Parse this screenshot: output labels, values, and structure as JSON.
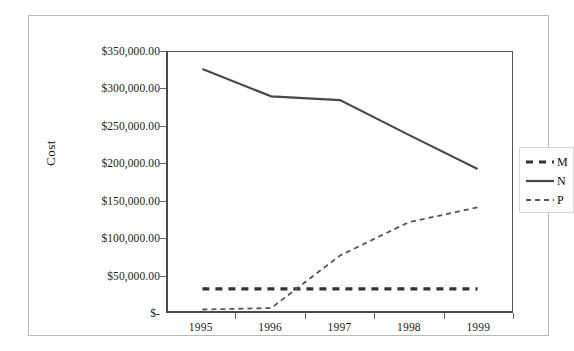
{
  "chart_data": {
    "type": "line",
    "title": "",
    "xlabel": "",
    "ylabel": "Cost",
    "x": [
      1995,
      1996,
      1997,
      1998,
      1999
    ],
    "categories": [
      "1995",
      "1996",
      "1997",
      "1998",
      "1999"
    ],
    "ylim": [
      0,
      350000
    ],
    "ytick_values": [
      0,
      50000,
      100000,
      150000,
      200000,
      250000,
      300000,
      350000
    ],
    "ytick_labels": [
      "$-",
      "$50,000.00",
      "$100,000.00",
      "$150,000.00",
      "$200,000.00",
      "$250,000.00",
      "$300,000.00",
      "$350,000.00"
    ],
    "grid": false,
    "legend_position": "right",
    "series": [
      {
        "name": "M",
        "style": "thick-dashed",
        "color": "#333333",
        "values": [
          30000,
          30000,
          30000,
          30000,
          30000
        ]
      },
      {
        "name": "N",
        "style": "solid",
        "color": "#4a4a4a",
        "values": [
          327000,
          290000,
          285000,
          238000,
          192000
        ]
      },
      {
        "name": "P",
        "style": "thin-dashed",
        "color": "#555555",
        "values": [
          2000,
          4000,
          75000,
          120000,
          140000
        ]
      }
    ]
  },
  "axes": {
    "y_title": "Cost"
  },
  "legend": {
    "entries": [
      {
        "label": "M"
      },
      {
        "label": "N"
      },
      {
        "label": "P"
      }
    ]
  }
}
